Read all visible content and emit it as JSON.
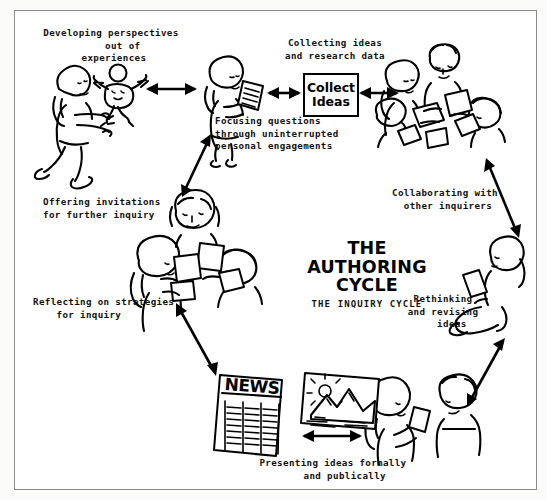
{
  "figure": {
    "title": "THE\nAUTHORING\nCYCLE",
    "subtitle": "THE INQUIRY CYCLE",
    "center_box": {
      "line1": "Collect",
      "line2": "Ideas"
    },
    "captions": {
      "developing": "Developing perspectives\n    out of\n experiences",
      "collecting": "Collecting ideas\nand research data",
      "focusing": "Focusing questions\nthrough uninterrupted\npersonal engagements",
      "collaborating": "Collaborating with\n other inquirers",
      "rethinking": "Rethinking\nand revising\n   ideas",
      "presenting": "Presenting ideas formally\n    and publically",
      "reflecting": "Reflecting on strategies\n    for inquiry",
      "offering": "Offering invitations\nfor further inquiry"
    },
    "newspaper_masthead": "NEWS",
    "colors": {
      "ink": "#000000",
      "paper": "#ffffff",
      "frame": "#8a8a8a",
      "page_background": "#fbfbfa"
    }
  }
}
